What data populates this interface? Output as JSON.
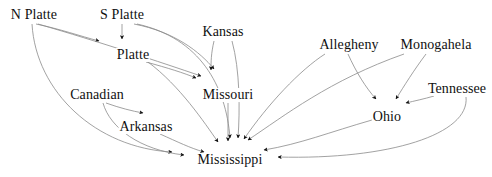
{
  "diagram": {
    "type": "directed-graph",
    "canvas": {
      "width": 492,
      "height": 177
    },
    "colors": {
      "background": "#ffffff",
      "edge": "#8a8a8a",
      "arrowhead": "#101010",
      "label_text": "#101010"
    },
    "nodes": [
      {
        "id": "n_platte",
        "label": "N Platte",
        "x": 34,
        "y": 15
      },
      {
        "id": "s_platte",
        "label": "S Platte",
        "x": 122,
        "y": 15
      },
      {
        "id": "kansas",
        "label": "Kansas",
        "x": 223,
        "y": 32
      },
      {
        "id": "platte",
        "label": "Platte",
        "x": 133,
        "y": 55
      },
      {
        "id": "missouri",
        "label": "Missouri",
        "x": 228,
        "y": 95
      },
      {
        "id": "canadian",
        "label": "Canadian",
        "x": 97,
        "y": 95
      },
      {
        "id": "arkansas",
        "label": "Arkansas",
        "x": 146,
        "y": 127
      },
      {
        "id": "mississippi",
        "label": "Mississippi",
        "x": 230,
        "y": 160
      },
      {
        "id": "allegheny",
        "label": "Allegheny",
        "x": 349,
        "y": 45
      },
      {
        "id": "monogahela",
        "label": "Monogahela",
        "x": 436,
        "y": 45
      },
      {
        "id": "tennessee",
        "label": "Tennessee",
        "x": 457,
        "y": 89
      },
      {
        "id": "ohio",
        "label": "Ohio",
        "x": 387,
        "y": 117
      }
    ],
    "edges": [
      {
        "from": "n_platte",
        "to": "platte"
      },
      {
        "from": "n_platte",
        "to": "missouri"
      },
      {
        "from": "n_platte",
        "to": "mississippi"
      },
      {
        "from": "s_platte",
        "to": "platte"
      },
      {
        "from": "s_platte",
        "to": "missouri"
      },
      {
        "from": "s_platte",
        "to": "mississippi"
      },
      {
        "from": "kansas",
        "to": "missouri"
      },
      {
        "from": "kansas",
        "to": "mississippi"
      },
      {
        "from": "platte",
        "to": "missouri"
      },
      {
        "from": "platte",
        "to": "mississippi"
      },
      {
        "from": "missouri",
        "to": "mississippi"
      },
      {
        "from": "canadian",
        "to": "arkansas"
      },
      {
        "from": "canadian",
        "to": "mississippi"
      },
      {
        "from": "arkansas",
        "to": "mississippi"
      },
      {
        "from": "allegheny",
        "to": "ohio"
      },
      {
        "from": "allegheny",
        "to": "mississippi"
      },
      {
        "from": "monogahela",
        "to": "ohio"
      },
      {
        "from": "monogahela",
        "to": "mississippi"
      },
      {
        "from": "tennessee",
        "to": "ohio"
      },
      {
        "from": "tennessee",
        "to": "mississippi"
      },
      {
        "from": "ohio",
        "to": "mississippi"
      }
    ]
  }
}
